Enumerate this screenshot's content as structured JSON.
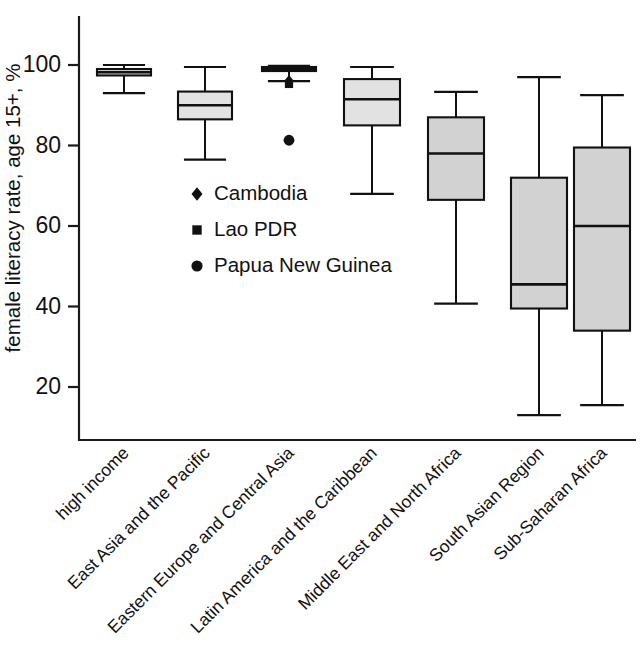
{
  "chart_data": {
    "type": "box",
    "title": "",
    "xlabel": "",
    "ylabel": "female literacy rate, age 15+, %",
    "ylim": [
      8,
      104
    ],
    "yticks": [
      20,
      40,
      60,
      80,
      100
    ],
    "ytick_labels": [
      "20",
      "40",
      "60",
      "80",
      "100"
    ],
    "grid": false,
    "legend_position": "inside-left-middle",
    "categories": [
      "high income",
      "East Asia and the Pacific",
      "Eastern Europe and Central Asia",
      "Latin America and the Caribbean",
      "Middle East and North Africa",
      "South Asian Region",
      "Sub-Saharan Africa"
    ],
    "boxes": [
      {
        "category": "high income",
        "whisker_low": 93.0,
        "q1": 97.4,
        "median": 98.2,
        "q3": 99.0,
        "whisker_high": 100.0,
        "outliers": []
      },
      {
        "category": "East Asia and the Pacific",
        "whisker_low": 76.5,
        "q1": 86.5,
        "median": 90.0,
        "q3": 93.4,
        "whisker_high": 99.5,
        "outliers": []
      },
      {
        "category": "Eastern Europe and Central Asia",
        "whisker_low": 96.0,
        "q1": 98.5,
        "median": 99.0,
        "q3": 99.5,
        "whisker_high": 99.8,
        "outliers": [
          81.3
        ]
      },
      {
        "category": "Latin America and the Caribbean",
        "whisker_low": 68.0,
        "q1": 85.0,
        "median": 91.5,
        "q3": 96.5,
        "whisker_high": 99.5,
        "outliers": []
      },
      {
        "category": "Middle East and North Africa",
        "whisker_low": 40.7,
        "q1": 66.5,
        "median": 78.0,
        "q3": 87.0,
        "whisker_high": 93.3,
        "outliers": []
      },
      {
        "category": "South Asian Region",
        "whisker_low": 13.0,
        "q1": 39.5,
        "median": 45.5,
        "q3": 72.0,
        "whisker_high": 97.0,
        "outliers": []
      },
      {
        "category": "Sub-Saharan Africa",
        "whisker_low": 15.5,
        "q1": 34.0,
        "median": 60.0,
        "q3": 79.5,
        "whisker_high": 92.5,
        "outliers": []
      }
    ],
    "country_markers": [
      {
        "name": "Cambodia",
        "glyph": "diamond",
        "category": "Eastern Europe and Central Asia",
        "value": 96.0
      },
      {
        "name": "Lao PDR",
        "glyph": "square",
        "category": "Eastern Europe and Central Asia",
        "value": 95.3
      },
      {
        "name": "Papua New Guinea",
        "glyph": "circle",
        "category": "Eastern Europe and Central Asia",
        "value": 81.3
      }
    ],
    "legend": [
      {
        "glyph": "diamond",
        "label": "Cambodia"
      },
      {
        "glyph": "square",
        "label": "Lao PDR"
      },
      {
        "glyph": "circle",
        "label": "Papua New Guinea"
      }
    ],
    "colors": {
      "box_fill": "#d2d2d2",
      "line": "#111111",
      "background": "#ffffff"
    }
  }
}
